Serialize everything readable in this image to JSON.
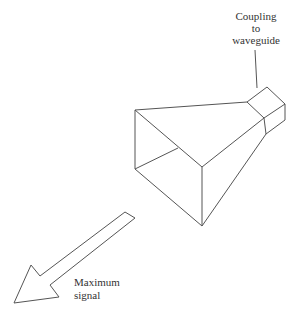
{
  "diagram": {
    "labels": {
      "coupling": [
        "Coupling",
        "to",
        "waveguide"
      ],
      "signal": [
        "Maximum",
        "signal"
      ]
    },
    "colors": {
      "stroke": "#555555",
      "text": "#333333",
      "background": "#ffffff"
    }
  }
}
